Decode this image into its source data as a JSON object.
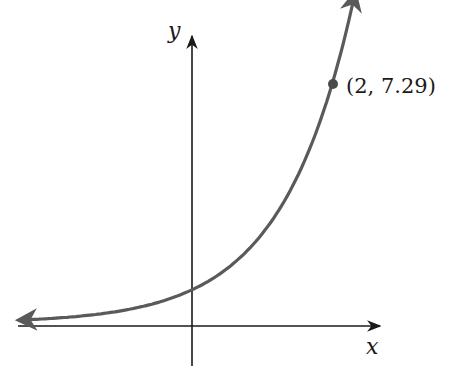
{
  "chart_data": {
    "type": "line",
    "title": "",
    "xlabel": "x",
    "ylabel": "y",
    "function": "y = 2.7^x",
    "series": [
      {
        "name": "exponential curve",
        "x": [
          -2.45,
          -2,
          -1.5,
          -1,
          -0.5,
          0,
          0.5,
          1,
          1.5,
          2,
          2.33
        ],
        "y": [
          0.09,
          0.14,
          0.23,
          0.37,
          0.61,
          1.0,
          1.64,
          2.7,
          4.44,
          7.29,
          10.1
        ]
      }
    ],
    "highlighted_point": {
      "x": 2,
      "y": 7.29,
      "label": "(2, 7.29)"
    },
    "grid": false,
    "ticks": false,
    "colors": {
      "curve": "#5a5a5a",
      "axes": "#1a1a1a",
      "point": "#4a4a4a"
    }
  },
  "labels": {
    "x_axis": "x",
    "y_axis": "y",
    "point": "(2, 7.29)"
  }
}
